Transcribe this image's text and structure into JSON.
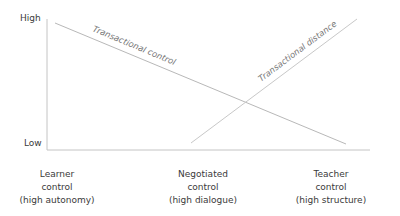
{
  "diagram": {
    "y_axis": {
      "high_label": "High",
      "low_label": "Low"
    },
    "lines": [
      {
        "name": "Transactional control",
        "from": [
          55,
          23
        ],
        "to": [
          346,
          144
        ],
        "color": "#b8b8b8"
      },
      {
        "name": "Transactional distance",
        "from": [
          191,
          143
        ],
        "to": [
          357,
          19
        ],
        "color": "#c8c8c8"
      }
    ],
    "x_categories": [
      {
        "line1": "Learner",
        "line2": "control",
        "line3": "(high autonomy)"
      },
      {
        "line1": "Negotiated",
        "line2": "control",
        "line3": "(high dialogue)"
      },
      {
        "line1": "Teacher",
        "line2": "control",
        "line3": "(high structure)"
      }
    ],
    "colors": {
      "axis": "#bfbfbf",
      "text": "#3a3a3a",
      "line_label": "#777777"
    }
  }
}
